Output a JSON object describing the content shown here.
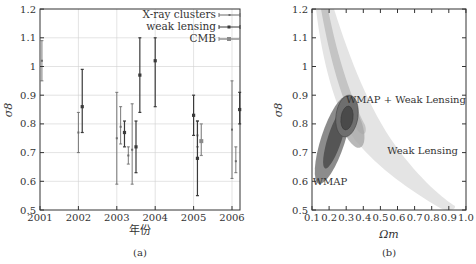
{
  "chart_data": [
    {
      "panel": "(a)",
      "type": "scatter",
      "title": "",
      "xlabel": "年份",
      "ylabel": "σ8",
      "xlim": [
        2001,
        2006.3
      ],
      "ylim": [
        0.5,
        1.2
      ],
      "xticks": [
        "2001",
        "2002",
        "2003",
        "2004",
        "2005",
        "2006"
      ],
      "yticks": [
        "0.5",
        "0.6",
        "0.7",
        "0.8",
        "0.9",
        "1",
        "1.1",
        "1.2"
      ],
      "grid": true,
      "legend_position": "upper right",
      "legend": [
        "X-ray clusters",
        "weak lensing",
        "CMB"
      ],
      "series": [
        {
          "name": "X-ray clusters",
          "points": [
            {
              "x": 2001.05,
              "y": 1.02,
              "lo": 0.95,
              "hi": 1.09
            },
            {
              "x": 2002.0,
              "y": 0.77,
              "lo": 0.7,
              "hi": 0.84
            },
            {
              "x": 2003.0,
              "y": 0.75,
              "lo": 0.59,
              "hi": 0.91
            },
            {
              "x": 2003.1,
              "y": 0.79,
              "lo": 0.73,
              "hi": 0.86
            },
            {
              "x": 2003.3,
              "y": 0.69,
              "lo": 0.66,
              "hi": 0.72
            },
            {
              "x": 2003.4,
              "y": 0.71,
              "lo": 0.59,
              "hi": 0.87
            },
            {
              "x": 2005.1,
              "y": 0.76,
              "lo": 0.72,
              "hi": 0.81
            },
            {
              "x": 2006.0,
              "y": 0.78,
              "lo": 0.61,
              "hi": 0.95
            },
            {
              "x": 2006.1,
              "y": 0.67,
              "lo": 0.63,
              "hi": 0.72
            }
          ]
        },
        {
          "name": "weak lensing",
          "points": [
            {
              "x": 2002.1,
              "y": 0.86,
              "lo": 0.77,
              "hi": 0.99
            },
            {
              "x": 2003.2,
              "y": 0.77,
              "lo": 0.72,
              "hi": 0.81
            },
            {
              "x": 2003.5,
              "y": 0.72,
              "lo": 0.63,
              "hi": 0.81
            },
            {
              "x": 2003.6,
              "y": 0.97,
              "lo": 0.84,
              "hi": 1.1
            },
            {
              "x": 2004.0,
              "y": 1.02,
              "lo": 0.86,
              "hi": 1.1
            },
            {
              "x": 2005.0,
              "y": 0.83,
              "lo": 0.76,
              "hi": 0.9
            },
            {
              "x": 2005.1,
              "y": 0.68,
              "lo": 0.55,
              "hi": 0.81
            },
            {
              "x": 2006.2,
              "y": 0.85,
              "lo": 0.8,
              "hi": 0.91
            }
          ]
        },
        {
          "name": "CMB",
          "points": [
            {
              "x": 2005.2,
              "y": 0.74,
              "lo": 0.69,
              "hi": 0.8
            }
          ]
        }
      ]
    },
    {
      "panel": "(b)",
      "type": "contour",
      "title": "",
      "xlabel": "Ωm",
      "ylabel": "σ8",
      "xlim": [
        0.1,
        1.0
      ],
      "ylim": [
        0.5,
        1.2
      ],
      "xticks": [
        "0.1",
        "0.2",
        "0.3",
        "0.4",
        "0.5",
        "0.6",
        "0.7",
        "0.8",
        "0.9",
        "1.0"
      ],
      "yticks": [
        "0.5",
        "0.6",
        "0.7",
        "0.8",
        "0.9",
        "1",
        "1.1",
        "1.2"
      ],
      "grid": false,
      "annotations": [
        {
          "text": "WMAP + Weak Lensing",
          "x": 0.33,
          "y": 0.89
        },
        {
          "text": "Weak Lensing",
          "x": 0.72,
          "y": 0.72
        },
        {
          "text": "WMAP",
          "x": 0.19,
          "y": 0.62
        }
      ],
      "regions": [
        {
          "name": "Weak Lensing",
          "shape": "curved band",
          "from": [
            0.13,
            1.2
          ],
          "to": [
            0.85,
            0.51
          ]
        },
        {
          "name": "WMAP",
          "shape": "ellipse",
          "center": [
            0.24,
            0.74
          ],
          "orientation": "tilted"
        },
        {
          "name": "WMAP + Weak Lensing",
          "shape": "ellipse",
          "center": [
            0.3,
            0.84
          ]
        }
      ]
    }
  ],
  "captions": {
    "a": "(a)",
    "b": "(b)"
  },
  "colors": {
    "axis": "#333333",
    "grid": "#d0d0d0",
    "xray": "#6a6a6a",
    "weaklensing": "#3a3a3a",
    "cmb": "#8a8a8a",
    "wl_outer": "#e2e2e2",
    "wl_inner": "#c8c8c8",
    "wmap_outer": "#8a8a8a",
    "wmap_inner": "#5a5a5a",
    "combo": "#444444"
  }
}
